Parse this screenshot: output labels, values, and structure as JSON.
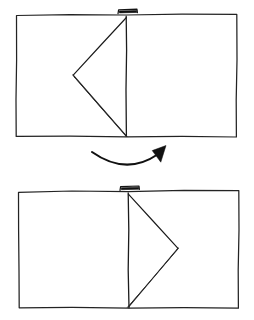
{
  "document": {
    "title": "Paper Folding Step Diagram",
    "style": "hand-drawn line illustration",
    "background_color": "#ffffff",
    "ink_color": "#1a1a1a",
    "width": 254,
    "height": 320
  },
  "steps": [
    {
      "id": "step-before",
      "label": "Before: triangular flap lies on the left page",
      "sheet": {
        "name": "open-sheet",
        "corners": {
          "top_left": [
            16,
            15
          ],
          "top_right": [
            237,
            14
          ],
          "bottom_right": [
            236,
            137
          ],
          "bottom_left": [
            16,
            136
          ]
        }
      },
      "center_fold": {
        "name": "center-fold-line",
        "top": [
          126,
          16
        ],
        "bottom": [
          126,
          136
        ]
      },
      "flap": {
        "name": "triangular-flap-left",
        "apex": [
          73,
          75
        ],
        "hinge_top": [
          126,
          17
        ],
        "hinge_bottom": [
          126,
          136
        ],
        "doubled_edge": true
      },
      "tab": {
        "name": "center-tab-mark",
        "left": [
          118,
          13
        ],
        "right": [
          137,
          12
        ],
        "depth": 5
      }
    },
    {
      "id": "step-after",
      "label": "After: triangular flap has been flipped onto the right page",
      "sheet": {
        "name": "open-sheet",
        "corners": {
          "top_left": [
            18,
            192
          ],
          "top_right": [
            239,
            190
          ],
          "bottom_right": [
            238,
            308
          ],
          "bottom_left": [
            19,
            308
          ]
        }
      },
      "center_fold": {
        "name": "center-fold-line",
        "top": [
          128,
          193
        ],
        "bottom": [
          129,
          308
        ]
      },
      "flap": {
        "name": "triangular-flap-right",
        "apex": [
          178,
          248
        ],
        "hinge_top": [
          128,
          194
        ],
        "hinge_bottom": [
          129,
          307
        ],
        "doubled_edge": true
      },
      "tab": {
        "name": "center-tab-mark",
        "left": [
          120,
          190
        ],
        "right": [
          139,
          189
        ],
        "depth": 5
      }
    }
  ],
  "arrow": {
    "name": "flip-direction-arrow",
    "description": "curved arrow sweeping left to right indicating the flap is flipped over the center fold",
    "start": [
      92,
      152
    ],
    "control": [
      126,
      174
    ],
    "end": [
      158,
      153
    ],
    "head_tip": [
      165,
      146
    ],
    "color": "#111111"
  }
}
